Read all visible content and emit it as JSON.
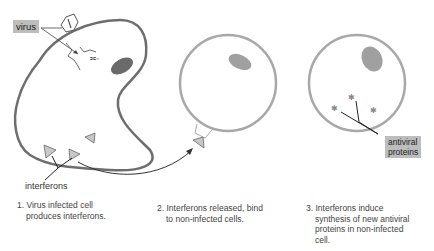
{
  "labels": {
    "virus": "virus",
    "interferons": "interferons",
    "antiviral_line1": "antiviral",
    "antiviral_line2": "proteins"
  },
  "captions": [
    {
      "num": "1.",
      "line1": "Virus infected cell",
      "line2": "produces interferons."
    },
    {
      "num": "2.",
      "line1": "Interferons released, bind",
      "line2": "to non-infected cells."
    },
    {
      "num": "3.",
      "line1": "Interferons induce",
      "line2": "synthesis of new antiviral",
      "line3": "proteins in non-infected",
      "line4": "cell."
    }
  ],
  "colors": {
    "infected_membrane": "#6e6e6e",
    "healthy_membrane": "#a8a8a8",
    "nucleus_dark": "#6a6a6a",
    "nucleus_light": "#a0a0a0",
    "tag_bg": "#bdbdbd",
    "interferon_fill": "#c8c8c8"
  }
}
